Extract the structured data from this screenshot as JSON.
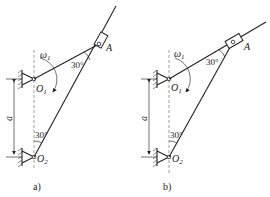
{
  "figure": {
    "panels": [
      {
        "id": "a",
        "caption": "a)",
        "labels": {
          "omega": "ω",
          "omega_sub": "1",
          "O1": "O",
          "O1_sub": "1",
          "O2": "O",
          "O2_sub": "2",
          "A": "A",
          "dimension": "a",
          "angle_top": "30°",
          "angle_bottom": "30°"
        },
        "description": "Slider at A on rod through O2; crank O1A"
      },
      {
        "id": "b",
        "caption": "b)",
        "labels": {
          "omega": "ω",
          "omega_sub": "1",
          "O1": "O",
          "O1_sub": "1",
          "O2": "O",
          "O2_sub": "2",
          "A": "A",
          "dimension": "a",
          "angle_top": "30°",
          "angle_bottom": "30°"
        },
        "description": "Slider at A on rod through O1; link O2A"
      }
    ],
    "colors": {
      "line": "#222222",
      "dashed": "#777777",
      "background": "#ffffff"
    }
  }
}
